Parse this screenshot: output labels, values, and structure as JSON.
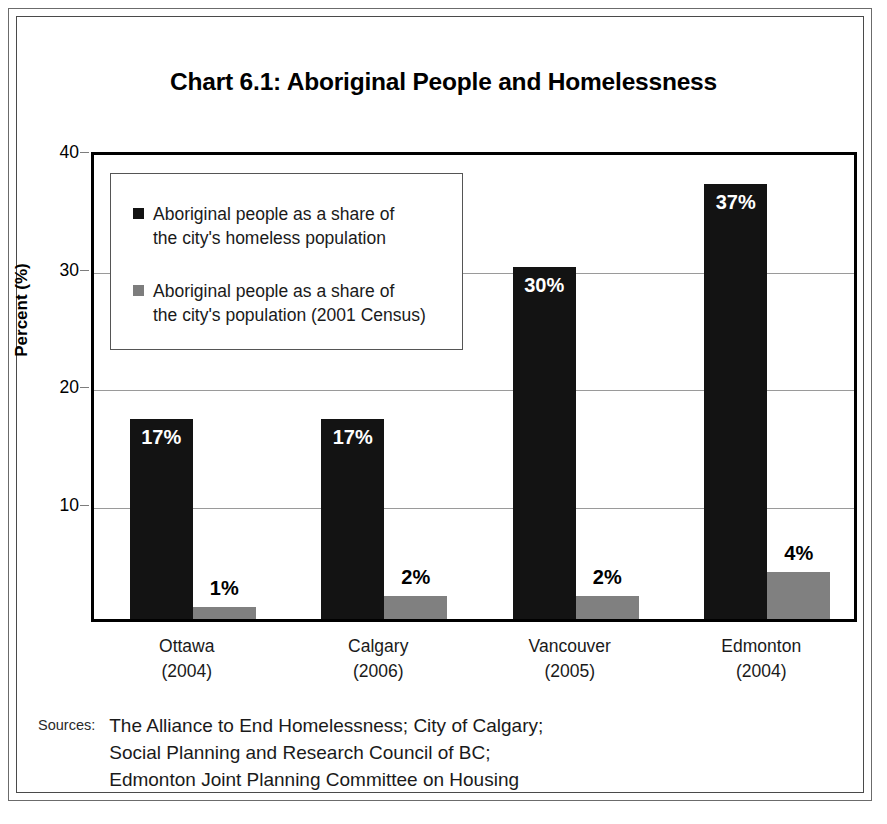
{
  "chart_data": {
    "type": "bar",
    "title": "Chart 6.1: Aboriginal People and Homelessness",
    "xlabel": "",
    "ylabel": "Percent (%)",
    "ylim": [
      0,
      40
    ],
    "yticks": [
      10,
      20,
      30,
      40
    ],
    "grid": true,
    "legend_position": "inside-upper-left",
    "categories": [
      "Ottawa",
      "Calgary",
      "Vancouver",
      "Edmonton"
    ],
    "category_years": [
      "(2004)",
      "(2006)",
      "(2005)",
      "(2004)"
    ],
    "series": [
      {
        "name": "Aboriginal people as a share of\nthe city's homeless population",
        "color": "#131313",
        "values": [
          17,
          17,
          30,
          37
        ],
        "labels": [
          "17%",
          "17%",
          "30%",
          "37%"
        ],
        "label_position": "inside"
      },
      {
        "name": "Aboriginal people as a share of\nthe city's population (2001 Census)",
        "color": "#808080",
        "values": [
          1,
          2,
          2,
          4
        ],
        "labels": [
          "1%",
          "2%",
          "2%",
          "4%"
        ],
        "label_position": "outside"
      }
    ],
    "ytick_labels": [
      "10",
      "20",
      "30",
      "40"
    ]
  },
  "sources": {
    "label": "Sources:",
    "text": "The Alliance to End Homelessness; City of Calgary;\nSocial Planning and Research Council of BC;\nEdmonton Joint Planning Committee on Housing"
  }
}
